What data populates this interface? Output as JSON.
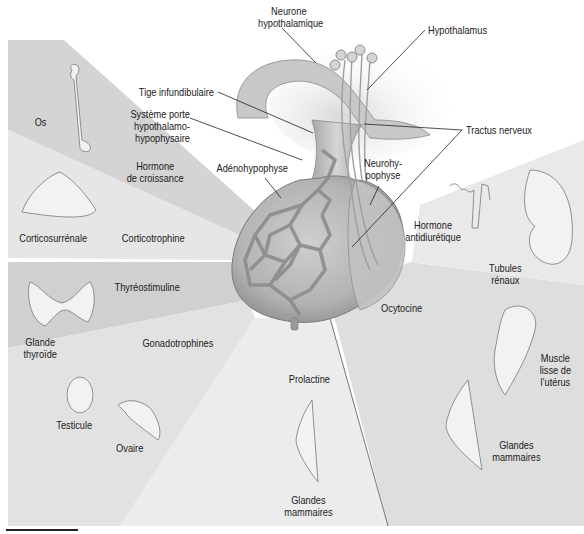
{
  "diagram": {
    "colors": {
      "background": "#ffffff",
      "wedge_dark": "#d3d3d3",
      "wedge_mid": "#dcdcdc",
      "wedge_light": "#e8e8e8",
      "gland": "#b9b9b9",
      "line": "#222222",
      "text": "#1a1a1a"
    },
    "structure_labels": {
      "neurone_hypothalamique": "Neurone\nhypothalamique",
      "hypothalamus": "Hypothalamus",
      "tige_infundibulaire": "Tige infundibulaire",
      "systeme_porte": "Système porte\nhypothalamo-\nhypophysaire",
      "tractus_nerveux": "Tractus nerveux",
      "adenohypophyse": "Adénohypophyse",
      "neurohypophyse": "Neurohy-\npophyse"
    },
    "hormones": {
      "hormone_croissance": "Hormone\nde croissance",
      "corticotrophine": "Corticotrophine",
      "thyreostimuline": "Thyréostimuline",
      "gonadotrophines": "Gonadotrophines",
      "prolactine": "Prolactine",
      "ocytocine": "Ocytocine",
      "hormone_antidiuretique": "Hormone\nantidiurétique"
    },
    "targets": {
      "os": "Os",
      "corticosurrenale": "Corticosurrénale",
      "glande_thyroide": "Glande\nthyroïde",
      "testicule": "Testicule",
      "ovaire": "Ovaire",
      "glandes_mammaires_prolactine": "Glandes\nmammaires",
      "muscle_uterus": "Muscle\nlisse de\nl’utérus",
      "glandes_mammaires_ocytocine": "Glandes\nmammaires",
      "tubules_renaux": "Tubules\nrénaux"
    }
  }
}
